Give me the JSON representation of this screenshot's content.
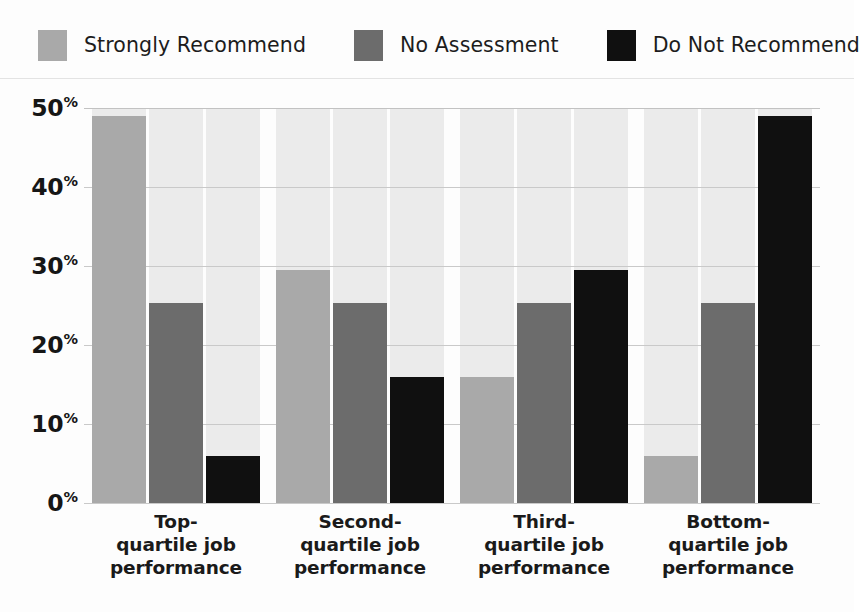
{
  "legend": {
    "items": [
      {
        "label": "Strongly Recommend",
        "color": "#a9a9a9",
        "swatch_name": "legend-swatch-strongly-recommend"
      },
      {
        "label": "No Assessment",
        "color": "#6c6c6c",
        "swatch_name": "legend-swatch-no-assessment"
      },
      {
        "label": "Do Not Recommend",
        "color": "#101010",
        "swatch_name": "legend-swatch-do-not-recommend"
      }
    ]
  },
  "axis": {
    "y_ticks": [
      {
        "value": 50,
        "number": "50",
        "suffix": "%"
      },
      {
        "value": 40,
        "number": "40",
        "suffix": "%"
      },
      {
        "value": 30,
        "number": "30",
        "suffix": "%"
      },
      {
        "value": 20,
        "number": "20",
        "suffix": "%"
      },
      {
        "value": 10,
        "number": "10",
        "suffix": "%"
      },
      {
        "value": 0,
        "number": "0",
        "suffix": "%"
      }
    ],
    "x_categories": [
      {
        "line1": "Top-",
        "line2": "quartile job",
        "line3": "performance"
      },
      {
        "line1": "Second-",
        "line2": "quartile job",
        "line3": "performance"
      },
      {
        "line1": "Third-",
        "line2": "quartile job",
        "line3": "performance"
      },
      {
        "line1": "Bottom-",
        "line2": "quartile job",
        "line3": "performance"
      }
    ]
  },
  "chart_data": {
    "type": "bar",
    "title": "",
    "xlabel": "",
    "ylabel": "",
    "ylim": [
      0,
      50
    ],
    "ytick_values": [
      0,
      10,
      20,
      30,
      40,
      50
    ],
    "ytick_labels": [
      "0%",
      "10%",
      "20%",
      "30%",
      "40%",
      "50%"
    ],
    "grid": true,
    "legend_position": "top-left",
    "categories": [
      "Top-quartile job performance",
      "Second-quartile job performance",
      "Third-quartile job performance",
      "Bottom-quartile job performance"
    ],
    "series": [
      {
        "name": "Strongly Recommend",
        "color": "#a9a9a9",
        "values": [
          49,
          29.5,
          16,
          6
        ]
      },
      {
        "name": "No Assessment",
        "color": "#6c6c6c",
        "values": [
          25.3,
          25.3,
          25.3,
          25.3
        ]
      },
      {
        "name": "Do Not Recommend",
        "color": "#101010",
        "values": [
          6,
          16,
          29.5,
          49
        ]
      }
    ]
  },
  "colors": {
    "plot_background": "#fdfdfd",
    "column_band": "#ebebeb",
    "gridline": "#c9c9c9",
    "divider": "#e3e3e3",
    "text": "#1a1a1a"
  }
}
